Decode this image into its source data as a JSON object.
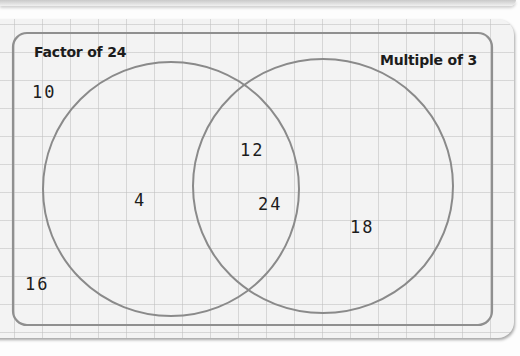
{
  "diagram": {
    "type": "venn",
    "sets": [
      {
        "id": "A",
        "label": "Factor of 24"
      },
      {
        "id": "B",
        "label": "Multiple of 3"
      }
    ],
    "regions": {
      "only_A": [
        "4"
      ],
      "A_and_B": [
        "12",
        "24"
      ],
      "only_B": [
        "18"
      ],
      "outside": [
        "10",
        "16"
      ]
    },
    "numbers": {
      "n10": "10",
      "n4": "4",
      "n12": "12",
      "n24": "24",
      "n18": "18",
      "n16": "16"
    },
    "colors": {
      "circle_stroke": "#8a8a8a",
      "frame_stroke": "#8f8f8f",
      "paper": "#f3f3f3",
      "grid": "#bebebe",
      "text": "#1c1c1c"
    }
  }
}
